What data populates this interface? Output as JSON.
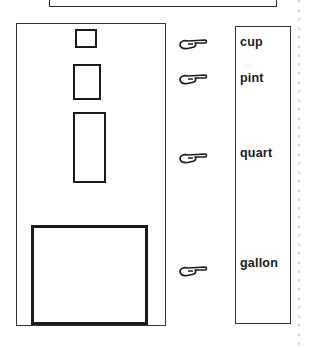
{
  "worksheet": {
    "units": [
      {
        "label": "cup"
      },
      {
        "label": "pint"
      },
      {
        "label": "quart"
      },
      {
        "label": "gallon"
      }
    ],
    "pointer_icon": "pointing-hand-icon",
    "ink_color": "#1a1a1a",
    "paper_color": "#ffffff"
  }
}
